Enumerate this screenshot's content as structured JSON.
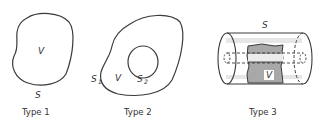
{
  "figure": {
    "panels": [
      {
        "caption": "Type 1",
        "labels": {
          "volume": "V",
          "surface": "S"
        }
      },
      {
        "caption": "Type 2",
        "labels": {
          "volume": "V",
          "outer_surface": "S",
          "outer_sub": "1",
          "inner_surface": "S",
          "inner_sub": "2"
        }
      },
      {
        "caption": "Type 3",
        "labels": {
          "volume": "V",
          "surface": "S"
        }
      }
    ],
    "colors": {
      "stroke": "#3a3a3a",
      "shade": "#9a9a9a",
      "light_band": "#d8d8d8"
    }
  }
}
